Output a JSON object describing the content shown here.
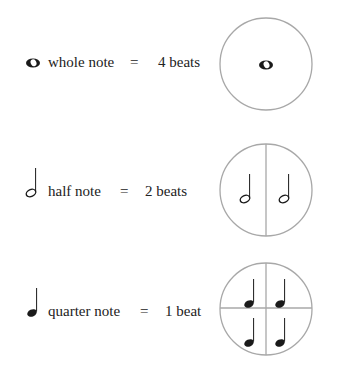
{
  "rows": [
    {
      "note_name": "whole note",
      "equals": "=",
      "beats": "4 beats",
      "icon": "whole-note-icon",
      "divisions": 1
    },
    {
      "note_name": "half note",
      "equals": "=",
      "beats": "2 beats",
      "icon": "half-note-icon",
      "divisions": 2
    },
    {
      "note_name": "quarter note",
      "equals": "=",
      "beats": "1 beat",
      "icon": "quarter-note-icon",
      "divisions": 4
    }
  ],
  "colors": {
    "circle_stroke": "#a8a8a8",
    "note": "#1a1a1a",
    "text": "#222222"
  }
}
